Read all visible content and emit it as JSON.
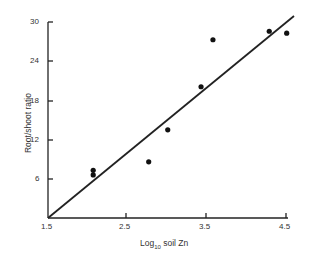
{
  "chart_data": {
    "type": "scatter",
    "title": "",
    "xlabel": "Log10 soil Zn",
    "ylabel": "Root/shoot ratio",
    "x_ticks": [
      "1.5",
      "2.5",
      "3.5",
      "4.5"
    ],
    "y_ticks": [
      "6",
      "12",
      "18",
      "24",
      "30"
    ],
    "xlim": [
      1.5,
      4.5
    ],
    "ylim": [
      0,
      30
    ],
    "grid": false,
    "series": [
      {
        "name": "observed",
        "x": [
          2.07,
          2.07,
          2.77,
          3.01,
          3.43,
          3.58,
          4.29,
          4.51
        ],
        "y": [
          7.3,
          6.6,
          8.6,
          13.5,
          20.1,
          27.3,
          28.6,
          28.3
        ]
      },
      {
        "name": "fit line",
        "type": "line",
        "x": [
          1.5,
          4.6
        ],
        "y": [
          0,
          30.8
        ]
      }
    ]
  },
  "labels": {
    "xlabel_main": "Log",
    "xlabel_sub": "10",
    "xlabel_rest": " soil Zn",
    "ylabel": "Root/shoot ratio"
  }
}
